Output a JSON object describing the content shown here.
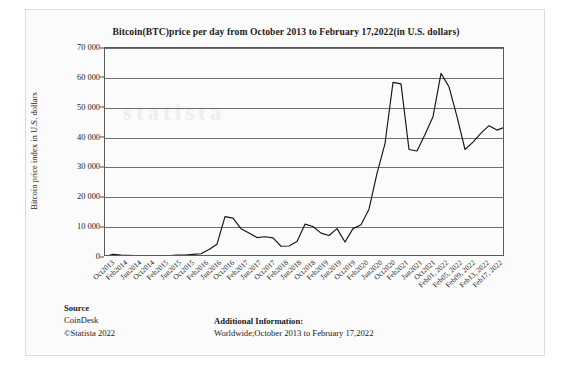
{
  "chart_data": {
    "type": "line",
    "title": "Bitcoin(BTC)price per day from October 2013 to February 17,2022(in U.S. dollars)",
    "xlabel": "",
    "ylabel": "Bitcoin price index in U.S. dollars",
    "ylim": [
      0,
      70000
    ],
    "yticks": [
      "0",
      "10 000",
      "20 000",
      "30 000",
      "40 000",
      "50 000",
      "60 000",
      "70 000"
    ],
    "ytick_values": [
      0,
      10000,
      20000,
      30000,
      40000,
      50000,
      60000,
      70000
    ],
    "grid": "horizontal",
    "legend": "none",
    "watermark": "statista",
    "categories": [
      "Oct2013",
      "Feb2014",
      "Jun2014",
      "Oct2014",
      "Feb2015",
      "Jun2015",
      "Oct2015",
      "Feb2016",
      "Jun2016",
      "Oct2016",
      "Feb2017",
      "Jun2017",
      "Oct2017",
      "Feb2018",
      "Jun2018",
      "Oct2018",
      "Feb2019",
      "Jun2019",
      "Oct2019",
      "Feb2020",
      "Jun2020",
      "Oct2020",
      "Feb2021",
      "Jun2021",
      "Oct2021",
      "Feb01, 2022",
      "Feb05, 2022",
      "Feb09, 2022",
      "Feb13, 2022",
      "Feb17, 2022"
    ],
    "series": [
      {
        "name": "Bitcoin price index",
        "x": [
          "Oct2013",
          "Dec2013",
          "Feb2014",
          "Jun2014",
          "Oct2014",
          "Feb2015",
          "Jun2015",
          "Oct2015",
          "Feb2016",
          "Jun2016",
          "Oct2016",
          "Dec2016",
          "Feb2017",
          "Jun2017",
          "Sep2017",
          "Dec2017",
          "Jan2018",
          "Feb2018",
          "Apr2018",
          "Jun2018",
          "Aug2018",
          "Oct2018",
          "Dec2018",
          "Feb2019",
          "Apr2019",
          "Jun2019",
          "Aug2019",
          "Oct2019",
          "Dec2019",
          "Feb2020",
          "Mar2020",
          "Jun2020",
          "Sep2020",
          "Nov2020",
          "Dec2020",
          "Jan2021",
          "Feb2021",
          "Apr2021",
          "May2021",
          "Jun2021",
          "Jul2021",
          "Aug2021",
          "Oct2021",
          "Nov2021",
          "Dec2021",
          "Jan2022",
          "Feb01, 2022",
          "Feb05, 2022",
          "Feb09, 2022",
          "Feb13, 2022",
          "Feb17, 2022"
        ],
        "values": [
          140,
          900,
          620,
          600,
          380,
          250,
          240,
          300,
          420,
          680,
          640,
          900,
          1100,
          2500,
          4300,
          13500,
          13000,
          9500,
          8000,
          6500,
          6800,
          6400,
          3600,
          3700,
          5200,
          11000,
          10200,
          8000,
          7200,
          9500,
          5000,
          9500,
          10800,
          16000,
          28000,
          38000,
          58500,
          58000,
          36000,
          35500,
          41000,
          47000,
          61500,
          57000,
          47000,
          36000,
          38500,
          41500,
          44000,
          42500,
          43500
        ]
      }
    ]
  },
  "footer": {
    "source_heading": "Source",
    "source_name": "CoinDesk",
    "source_copyright": "©Statista 2022",
    "additional_heading": "Additional Information:",
    "additional_text": "Worldwide;October 2013 to February 17,2022"
  }
}
